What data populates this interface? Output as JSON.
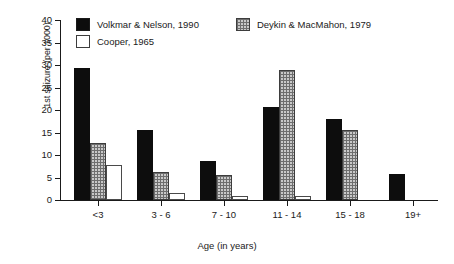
{
  "chart_data": {
    "type": "bar",
    "title": "",
    "xlabel": "Age (in years)",
    "ylabel": "1st seizure (per 1000)",
    "categories": [
      "<3",
      "3 - 6",
      "7 - 10",
      "11 - 14",
      "15 - 18",
      "19+"
    ],
    "ylim": [
      0,
      40
    ],
    "yticks": [
      0,
      5,
      10,
      15,
      20,
      25,
      30,
      35,
      40
    ],
    "ytick_labels": [
      "0",
      "5",
      "10",
      "15",
      "20",
      "25",
      "30",
      "35",
      "40"
    ],
    "grid": false,
    "legend_position": "top-left",
    "series": [
      {
        "name": "Volkmar & Nelson, 1990",
        "color": "#0d0d0d",
        "pattern": "solid-black",
        "values": [
          29.3,
          15.6,
          8.6,
          20.6,
          18.1,
          5.7
        ]
      },
      {
        "name": "Deykin & MacMahon, 1979",
        "color": "#c9c9c9",
        "pattern": "grid-hatch",
        "values": [
          12.7,
          6.2,
          5.6,
          28.8,
          15.6,
          0
        ]
      },
      {
        "name": "Cooper, 1965",
        "color": "#ffffff",
        "pattern": "open-white",
        "values": [
          7.7,
          1.6,
          1.0,
          1.0,
          0,
          0
        ]
      }
    ]
  }
}
